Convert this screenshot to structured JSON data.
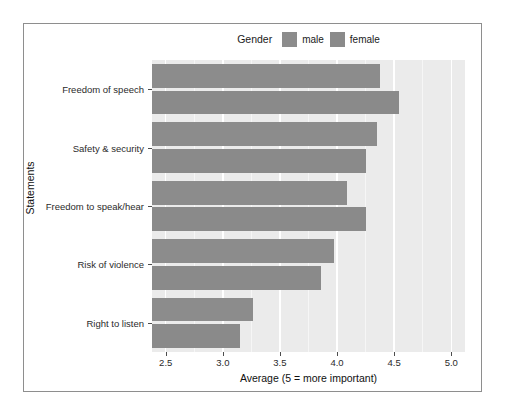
{
  "chart_data": {
    "type": "bar",
    "orientation": "horizontal",
    "title": "",
    "xlabel": "Average (5 = more important)",
    "ylabel": "Statements",
    "categories": [
      "Freedom of speech",
      "Safety & security",
      "Freedom to speak/hear",
      "Risk of violence",
      "Right to listen"
    ],
    "series": [
      {
        "name": "male",
        "values": [
          4.38,
          4.35,
          4.09,
          3.97,
          3.26
        ],
        "color": "#8c8c8c"
      },
      {
        "name": "female",
        "values": [
          4.54,
          4.25,
          4.25,
          3.86,
          3.15
        ],
        "color": "#8a8a8a"
      }
    ],
    "xlim": [
      2.38,
      5.12
    ],
    "x_ticks": [
      "2.5",
      "3.0",
      "3.5",
      "4.0",
      "4.5",
      "5.0"
    ],
    "x_tick_values": [
      2.5,
      3.0,
      3.5,
      4.0,
      4.5,
      5.0
    ],
    "x_minor_ticks": [
      2.75,
      3.25,
      3.75,
      4.25,
      4.75
    ],
    "grid": true,
    "legend": {
      "title": "Gender",
      "position": "top",
      "entries": [
        {
          "label": "male",
          "color": "#8c8c8c"
        },
        {
          "label": "female",
          "color": "#8a8a8a"
        }
      ]
    },
    "panel_background": "#ebebeb",
    "gridline_color": "#ffffff"
  }
}
